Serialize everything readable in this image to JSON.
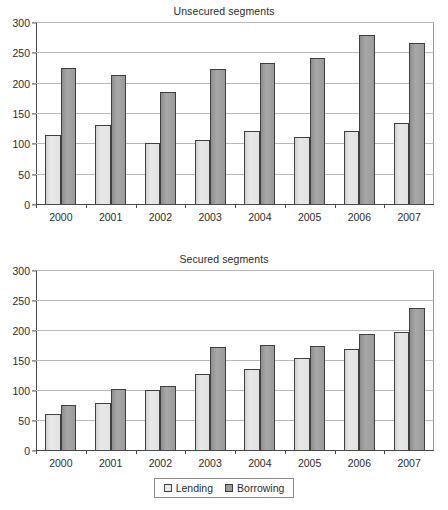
{
  "chart_data": [
    {
      "type": "bar",
      "title": "Unsecured segments",
      "xlabel": "",
      "ylabel": "",
      "ylim": [
        0,
        300
      ],
      "yticks": [
        0,
        50,
        100,
        150,
        200,
        250,
        300
      ],
      "grid": true,
      "legend_position": "bottom",
      "categories": [
        "2000",
        "2001",
        "2002",
        "2003",
        "2004",
        "2005",
        "2006",
        "2007"
      ],
      "series": [
        {
          "name": "Lending",
          "color": "#e8e8e8",
          "values": [
            114,
            130,
            100,
            106,
            121,
            110,
            120,
            133
          ]
        },
        {
          "name": "Borrowing",
          "color": "#9a9a9a",
          "values": [
            225,
            213,
            185,
            223,
            232,
            241,
            278,
            265
          ]
        }
      ]
    },
    {
      "type": "bar",
      "title": "Secured segments",
      "xlabel": "",
      "ylabel": "",
      "ylim": [
        0,
        300
      ],
      "yticks": [
        0,
        50,
        100,
        150,
        200,
        250,
        300
      ],
      "grid": true,
      "legend_position": "bottom",
      "categories": [
        "2000",
        "2001",
        "2002",
        "2003",
        "2004",
        "2005",
        "2006",
        "2007"
      ],
      "series": [
        {
          "name": "Lending",
          "color": "#e8e8e8",
          "values": [
            60,
            78,
            100,
            127,
            135,
            153,
            168,
            197
          ]
        },
        {
          "name": "Borrowing",
          "color": "#9a9a9a",
          "values": [
            75,
            101,
            107,
            172,
            175,
            174,
            194,
            236
          ]
        }
      ]
    }
  ],
  "legend": {
    "items": [
      {
        "label": "Lending",
        "swatch": "light-square-icon"
      },
      {
        "label": "Borrowing",
        "swatch": "dark-square-icon"
      }
    ]
  }
}
